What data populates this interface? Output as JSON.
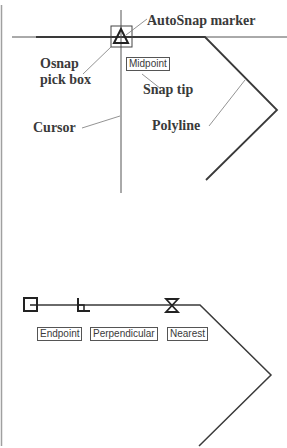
{
  "top_diagram": {
    "labels": {
      "autosnap_marker": "AutoSnap marker",
      "osnap_pick_box_line1": "Osnap",
      "osnap_pick_box_line2": "pick box",
      "snap_tip": "Snap tip",
      "cursor": "Cursor",
      "polyline": "Polyline"
    },
    "snap_tip_text": "Midpoint",
    "marker_type": "midpoint-triangle"
  },
  "bottom_diagram": {
    "snap_tips": [
      {
        "text": "Endpoint",
        "marker": "endpoint-square"
      },
      {
        "text": "Perpendicular",
        "marker": "perpendicular-symbol"
      },
      {
        "text": "Nearest",
        "marker": "nearest-hourglass"
      }
    ]
  },
  "colors": {
    "line": "#3a3a3a",
    "leader": "#777777",
    "border": "#9a9a9a"
  }
}
